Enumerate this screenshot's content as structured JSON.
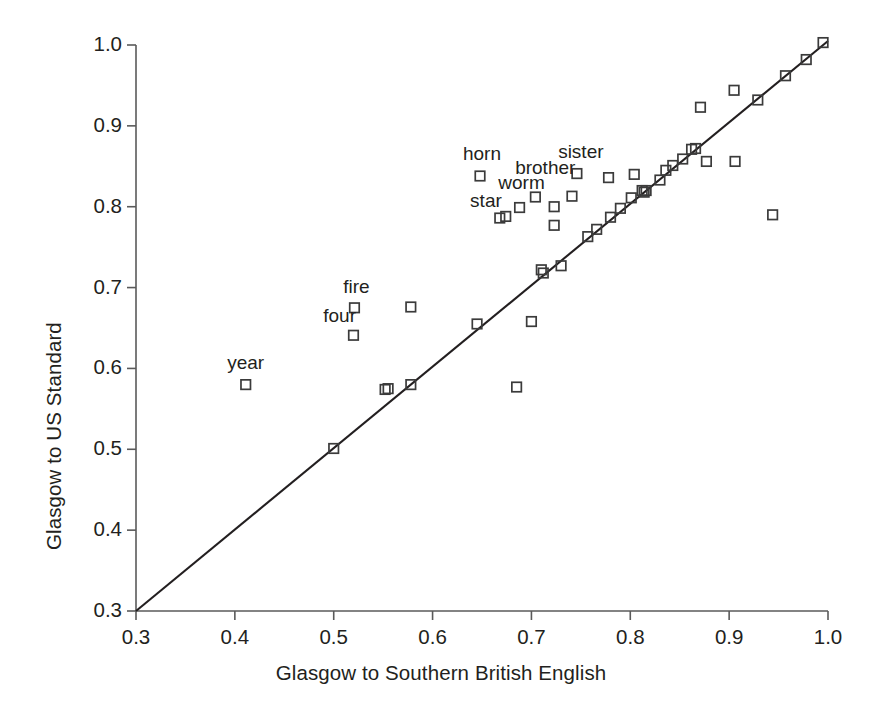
{
  "chart_data": {
    "type": "scatter",
    "title": "",
    "xlabel": "Glasgow to Southern British English",
    "ylabel": "Glasgow to US Standard",
    "xlim": [
      0.3,
      1.0
    ],
    "ylim": [
      0.3,
      1.0
    ],
    "grid": false,
    "legend": null,
    "x_ticks": [
      0.3,
      0.4,
      0.5,
      0.6,
      0.7,
      0.8,
      0.9,
      1.0
    ],
    "x_tick_labels": [
      "0.3",
      "0.4",
      "0.5",
      "0.6",
      "0.7",
      "0.8",
      "0.9",
      "1.0"
    ],
    "y_ticks": [
      0.3,
      0.4,
      0.5,
      0.6,
      0.7,
      0.8,
      0.9,
      1.0
    ],
    "y_tick_labels": [
      "0.3",
      "0.4",
      "0.5",
      "0.6",
      "0.7",
      "0.8",
      "0.9",
      "1.0"
    ],
    "marker": "open-square",
    "marker_color": "#3b3b3b",
    "reference_line": {
      "kind": "identity",
      "from": [
        0.3,
        0.3
      ],
      "to": [
        1.0,
        1.005
      ],
      "color": "#231f20"
    },
    "points": [
      {
        "x": 0.411,
        "y": 0.58,
        "label": "year"
      },
      {
        "x": 0.5,
        "y": 0.501,
        "label": ""
      },
      {
        "x": 0.52,
        "y": 0.641,
        "label": "four"
      },
      {
        "x": 0.521,
        "y": 0.675,
        "label": "fire"
      },
      {
        "x": 0.552,
        "y": 0.574,
        "label": ""
      },
      {
        "x": 0.555,
        "y": 0.575,
        "label": ""
      },
      {
        "x": 0.578,
        "y": 0.58,
        "label": ""
      },
      {
        "x": 0.578,
        "y": 0.676,
        "label": ""
      },
      {
        "x": 0.645,
        "y": 0.655,
        "label": ""
      },
      {
        "x": 0.648,
        "y": 0.838,
        "label": "horn"
      },
      {
        "x": 0.668,
        "y": 0.786,
        "label": "star"
      },
      {
        "x": 0.674,
        "y": 0.788,
        "label": ""
      },
      {
        "x": 0.685,
        "y": 0.577,
        "label": ""
      },
      {
        "x": 0.688,
        "y": 0.799,
        "label": ""
      },
      {
        "x": 0.7,
        "y": 0.658,
        "label": ""
      },
      {
        "x": 0.704,
        "y": 0.812,
        "label": "worm"
      },
      {
        "x": 0.71,
        "y": 0.722,
        "label": ""
      },
      {
        "x": 0.712,
        "y": 0.718,
        "label": ""
      },
      {
        "x": 0.723,
        "y": 0.777,
        "label": ""
      },
      {
        "x": 0.723,
        "y": 0.8,
        "label": ""
      },
      {
        "x": 0.73,
        "y": 0.727,
        "label": ""
      },
      {
        "x": 0.741,
        "y": 0.813,
        "label": ""
      },
      {
        "x": 0.746,
        "y": 0.841,
        "label": "sister"
      },
      {
        "x": 0.757,
        "y": 0.763,
        "label": ""
      },
      {
        "x": 0.766,
        "y": 0.772,
        "label": ""
      },
      {
        "x": 0.778,
        "y": 0.836,
        "label": ""
      },
      {
        "x": 0.78,
        "y": 0.787,
        "label": ""
      },
      {
        "x": 0.79,
        "y": 0.798,
        "label": ""
      },
      {
        "x": 0.801,
        "y": 0.811,
        "label": ""
      },
      {
        "x": 0.804,
        "y": 0.84,
        "label": ""
      },
      {
        "x": 0.812,
        "y": 0.82,
        "label": ""
      },
      {
        "x": 0.814,
        "y": 0.818,
        "label": ""
      },
      {
        "x": 0.816,
        "y": 0.82,
        "label": ""
      },
      {
        "x": 0.83,
        "y": 0.833,
        "label": ""
      },
      {
        "x": 0.836,
        "y": 0.845,
        "label": ""
      },
      {
        "x": 0.843,
        "y": 0.851,
        "label": ""
      },
      {
        "x": 0.853,
        "y": 0.859,
        "label": ""
      },
      {
        "x": 0.862,
        "y": 0.871,
        "label": ""
      },
      {
        "x": 0.866,
        "y": 0.872,
        "label": ""
      },
      {
        "x": 0.871,
        "y": 0.923,
        "label": ""
      },
      {
        "x": 0.877,
        "y": 0.856,
        "label": ""
      },
      {
        "x": 0.905,
        "y": 0.944,
        "label": ""
      },
      {
        "x": 0.906,
        "y": 0.856,
        "label": ""
      },
      {
        "x": 0.929,
        "y": 0.932,
        "label": ""
      },
      {
        "x": 0.944,
        "y": 0.79,
        "label": ""
      },
      {
        "x": 0.957,
        "y": 0.962,
        "label": ""
      },
      {
        "x": 0.978,
        "y": 0.982,
        "label": ""
      },
      {
        "x": 0.995,
        "y": 1.003,
        "label": ""
      }
    ],
    "annotations": [
      {
        "text": "year",
        "x": 0.411,
        "y": 0.605
      },
      {
        "text": "four",
        "x": 0.506,
        "y": 0.664
      },
      {
        "text": "fire",
        "x": 0.523,
        "y": 0.699
      },
      {
        "text": "horn",
        "x": 0.65,
        "y": 0.864
      },
      {
        "text": "star",
        "x": 0.654,
        "y": 0.806
      },
      {
        "text": "worm",
        "x": 0.69,
        "y": 0.828
      },
      {
        "text": "brother",
        "x": 0.714,
        "y": 0.847
      },
      {
        "text": "sister",
        "x": 0.75,
        "y": 0.866
      }
    ]
  },
  "axes": {
    "x_title": "Glasgow to Southern British English",
    "y_title": "Glasgow to US Standard",
    "x_tick_labels": [
      "0.3",
      "0.4",
      "0.5",
      "0.6",
      "0.7",
      "0.8",
      "0.9",
      "1.0"
    ],
    "y_tick_labels": [
      "0.3",
      "0.4",
      "0.5",
      "0.6",
      "0.7",
      "0.8",
      "0.9",
      "1.0"
    ]
  }
}
